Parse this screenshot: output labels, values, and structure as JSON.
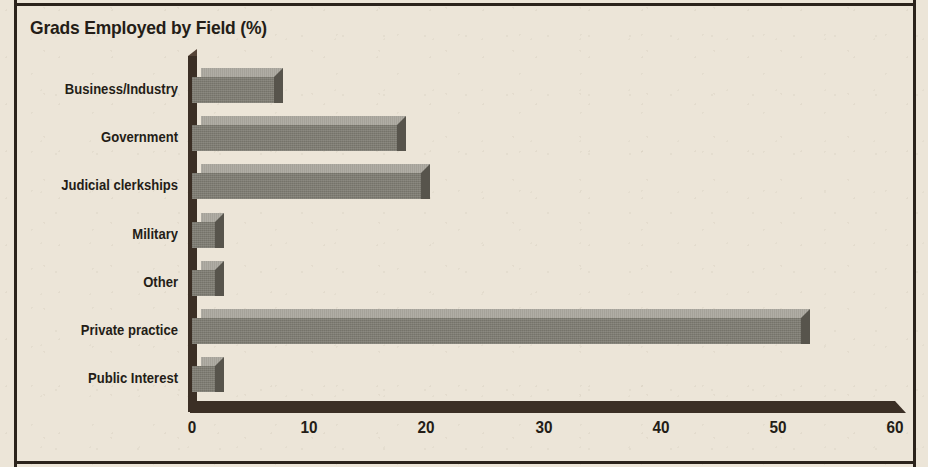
{
  "chart_data": {
    "type": "bar",
    "orientation": "horizontal",
    "title": "Grads Employed by Field (%)",
    "xlabel": "",
    "ylabel": "",
    "xlim": [
      0,
      60
    ],
    "xticks": [
      0,
      10,
      20,
      30,
      40,
      50,
      60
    ],
    "xtick_labels": [
      "0",
      "10",
      "20",
      "30",
      "40",
      "50",
      "60"
    ],
    "grid": false,
    "legend": null,
    "style": "3d-bar",
    "categories": [
      "Business/Industry",
      "Government",
      "Judicial clerkships",
      "Military",
      "Other",
      "Private practice",
      "Public Interest"
    ],
    "values": [
      7,
      17.5,
      19.5,
      2,
      2,
      52,
      2
    ],
    "colors": {
      "background": "#ece5d8",
      "bar_front": "#7e7c72",
      "bar_top": "#a5a299",
      "bar_side": "#57544c",
      "axis": "#3b2f25",
      "text": "#241d17",
      "frame": "#2b231c"
    }
  }
}
